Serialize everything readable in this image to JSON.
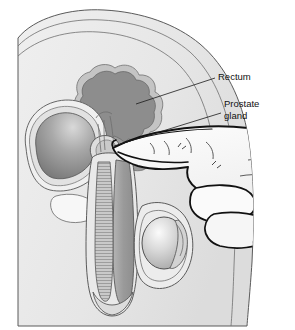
{
  "figure": {
    "type": "medical-illustration",
    "background_color": "#ffffff",
    "canvas": {
      "width": 295,
      "height": 330
    }
  },
  "annotations": [
    {
      "id": "rectum",
      "label": "Rectum",
      "label_lines": [
        "Rectum"
      ],
      "text_x": 218,
      "text_y": 77,
      "leader": {
        "x1": 215,
        "y1": 78,
        "x2": 136,
        "y2": 104
      }
    },
    {
      "id": "prostate-gland",
      "label": "Prostate gland",
      "label_lines": [
        "Prostate",
        "gland"
      ],
      "text_x": 224,
      "text_y": 104,
      "leader": {
        "x1": 221,
        "y1": 113,
        "x2": 114,
        "y2": 146
      }
    }
  ],
  "anatomy": [
    {
      "id": "body-silhouette",
      "name": "Body silhouette (sagittal pelvis)",
      "fill": "#e8e8e8"
    },
    {
      "id": "body-inner-tissue",
      "name": "Subcutaneous tissue layer",
      "fill": "#ededed"
    },
    {
      "id": "rectum-lumen",
      "name": "Rectum",
      "fill": "#8d8d8d"
    },
    {
      "id": "rectum-wall",
      "name": "Rectal wall",
      "fill": "#bdbdbd"
    },
    {
      "id": "bladder",
      "name": "Urinary bladder",
      "fill": "#9a9a9a"
    },
    {
      "id": "bladder-wall",
      "name": "Bladder wall",
      "fill": "#e3e3e3"
    },
    {
      "id": "prostate-gland-body",
      "name": "Prostate gland",
      "fill": "#d8d8d8"
    },
    {
      "id": "penis-shaft",
      "name": "Penis (corpus cavernosum)",
      "fill": "#9f9f9f"
    },
    {
      "id": "urethra-column",
      "name": "Urethra / corpus spongiosum",
      "fill": "#c4c4c4"
    },
    {
      "id": "testicle",
      "name": "Testicle",
      "fill": "#d0d0d0"
    },
    {
      "id": "scrotum",
      "name": "Scrotum",
      "fill": "#e6e6e6"
    },
    {
      "id": "pubic-bone",
      "name": "Pubic bone",
      "fill": "#f4f4f4"
    },
    {
      "id": "examining-hand",
      "name": "Examining hand",
      "fill": "#f2f2f2"
    },
    {
      "id": "index-finger",
      "name": "Index finger inserted into rectum",
      "fill": "#f2f2f2"
    }
  ],
  "colors": {
    "page_background": "#ffffff",
    "body_fill": "#e8e8e8",
    "tissue_fill": "#ededed",
    "rectum_dark": "#8d8d8d",
    "rectum_mid": "#bdbdbd",
    "bladder_dark": "#7e7e7e",
    "bladder_light": "#dcdcdc",
    "penis_fill": "#9f9f9f",
    "testicle_light": "#f2f2f2",
    "testicle_dark": "#a9a9a9",
    "hand_fill": "#f4f4f4",
    "ink": "#111111",
    "line_gray": "#6f6f6f"
  }
}
